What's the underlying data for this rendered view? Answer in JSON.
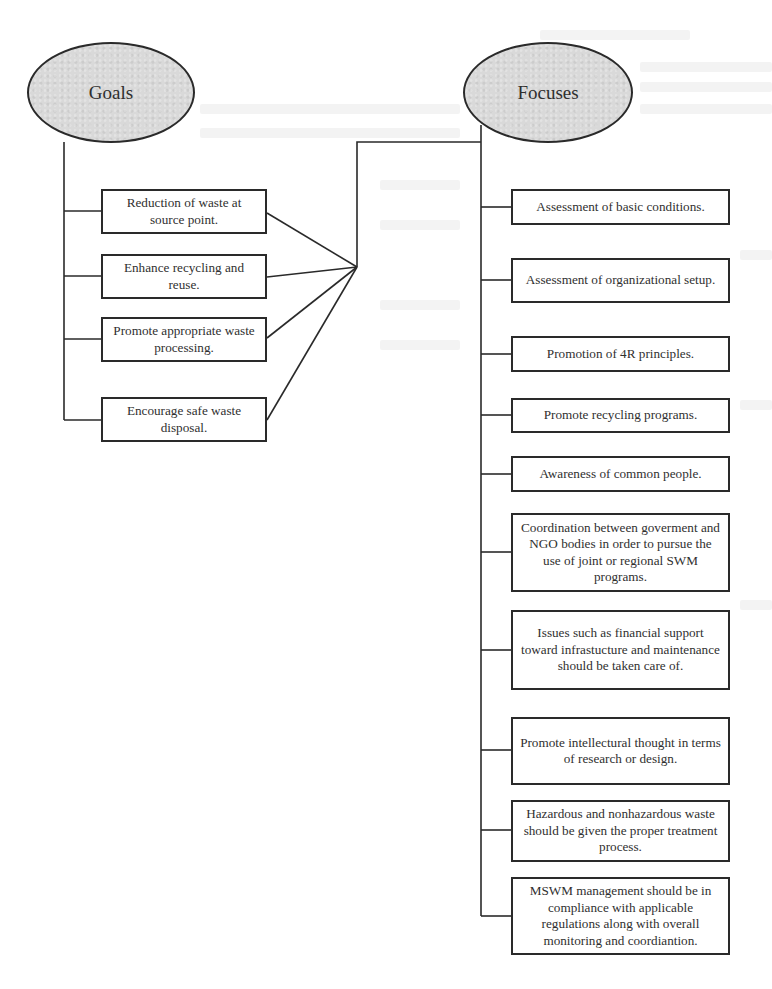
{
  "diagram": {
    "goals": {
      "title": "Goals",
      "items": [
        "Reduction of waste at source point.",
        "Enhance recycling and reuse.",
        "Promote appropriate waste processing.",
        "Encourage safe waste disposal."
      ]
    },
    "focuses": {
      "title": "Focuses",
      "items": [
        "Assessment of basic conditions.",
        "Assessment of organizational setup.",
        "Promotion of 4R principles.",
        "Promote recycling programs.",
        "Awareness of common people.",
        "Coordination between goverment and NGO bodies in order to pursue the use of joint or regional SWM programs.",
        "Issues such as financial support toward infrastucture and maintenance should be taken care of.",
        "Promote intellectural thought in terms of research or design.",
        "Hazardous and nonhazardous waste should be given the proper treatment process.",
        "MSWM management should be in compliance with applicable regulations along with overall monitoring and coordiantion."
      ]
    },
    "colors": {
      "ellipse_fill": "#d9d9d9",
      "stroke": "#2a2a2a",
      "text": "#2f2f2f",
      "background": "#ffffff"
    }
  }
}
